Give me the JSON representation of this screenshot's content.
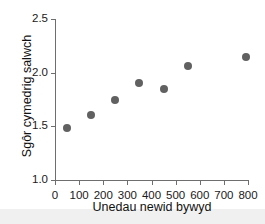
{
  "chart_data": {
    "type": "scatter",
    "title": "",
    "xlabel": "Unedau newid bywyd",
    "ylabel": "Sgôr cymedrig salwch",
    "xlim": [
      0,
      800
    ],
    "ylim": [
      1.0,
      2.5
    ],
    "grid": false,
    "legend": null,
    "marker_color": "#616161",
    "axis_color": "#6e6e6e",
    "x_ticks": [
      0,
      100,
      200,
      300,
      400,
      500,
      600,
      700,
      800
    ],
    "x_tick_labels": [
      "0",
      "100",
      "200",
      "300",
      "400",
      "500",
      "600",
      "700",
      "800"
    ],
    "y_ticks": [
      1.0,
      1.5,
      2.0,
      2.5
    ],
    "y_tick_labels": [
      "1.0",
      "1.5",
      "2.0",
      "2.5"
    ],
    "x": [
      50,
      150,
      250,
      350,
      450,
      550,
      790
    ],
    "y": [
      1.48,
      1.61,
      1.75,
      1.9,
      1.85,
      2.06,
      2.15
    ],
    "points": [
      {
        "x": 50,
        "y": 1.48
      },
      {
        "x": 150,
        "y": 1.61
      },
      {
        "x": 250,
        "y": 1.75
      },
      {
        "x": 350,
        "y": 1.9
      },
      {
        "x": 450,
        "y": 1.85
      },
      {
        "x": 550,
        "y": 2.06
      },
      {
        "x": 790,
        "y": 2.15
      }
    ]
  }
}
